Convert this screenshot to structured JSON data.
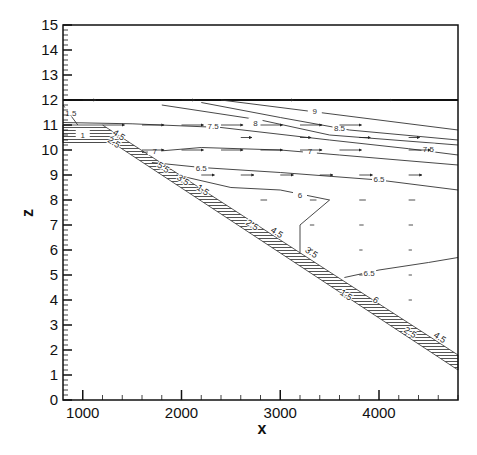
{
  "chart_data": {
    "type": "contour",
    "title": "",
    "xlabel": "x",
    "ylabel": "z",
    "xlim": [
      800,
      4800
    ],
    "ylim": [
      0,
      15
    ],
    "x_ticks": [
      1000,
      2000,
      3000,
      4000
    ],
    "x_tick_labels": [
      "1000",
      "2000",
      "3000",
      "4000"
    ],
    "y_ticks": [
      0,
      1,
      2,
      3,
      4,
      5,
      6,
      7,
      8,
      9,
      10,
      11,
      12,
      13,
      14,
      15
    ],
    "y_tick_labels": [
      "0",
      "1",
      "2",
      "3",
      "4",
      "5",
      "6",
      "7",
      "8",
      "9",
      "10",
      "11",
      "12",
      "13",
      "14",
      "15"
    ],
    "grid": false,
    "legend": null,
    "surface_z": 12,
    "bed_outline": {
      "top": [
        [
          800,
          11
        ],
        [
          1200,
          11
        ],
        [
          4800,
          1.8
        ]
      ],
      "bottom": [
        [
          800,
          10.3
        ],
        [
          1300,
          10.3
        ],
        [
          4800,
          1.2
        ]
      ]
    },
    "contours": [
      {
        "level": 9,
        "label": "9",
        "points": [
          [
            2400,
            12
          ],
          [
            3200,
            11.6
          ],
          [
            4000,
            11.2
          ],
          [
            4800,
            10.8
          ]
        ],
        "label_at": [
          3350,
          11.55
        ]
      },
      {
        "level": 8.5,
        "label": "8.5",
        "points": [
          [
            2200,
            11.9
          ],
          [
            3000,
            11.3
          ],
          [
            3700,
            10.8
          ],
          [
            4800,
            10.4
          ]
        ],
        "label_at": [
          3600,
          10.9
        ]
      },
      {
        "level": 8,
        "label": "8",
        "points": [
          [
            1800,
            11.8
          ],
          [
            2800,
            11.2
          ],
          [
            3500,
            10.6
          ],
          [
            4800,
            10.2
          ]
        ],
        "label_at": [
          2750,
          11.1
        ]
      },
      {
        "level": 7.5,
        "label": "7.5",
        "points": [
          [
            800,
            11.1
          ],
          [
            1500,
            11.05
          ],
          [
            2400,
            10.9
          ],
          [
            3500,
            10.4
          ],
          [
            4300,
            10.05
          ],
          [
            4800,
            9.8
          ]
        ],
        "label_at": [
          2320,
          10.95
        ]
      },
      {
        "level": 7.5,
        "label": "7.5",
        "points": [],
        "label_at": [
          4500,
          10.05
        ]
      },
      {
        "level": 7,
        "label": "7",
        "points": [
          [
            1600,
            9.9
          ],
          [
            2200,
            10.1
          ],
          [
            3000,
            10.0
          ],
          [
            3600,
            9.8
          ],
          [
            4800,
            9.4
          ]
        ],
        "label_at": [
          1730,
          9.95
        ]
      },
      {
        "level": 7,
        "label": "7",
        "points": [],
        "label_at": [
          3300,
          9.95
        ]
      },
      {
        "level": 6.5,
        "label": "6.5",
        "points": [
          [
            1700,
            9.5
          ],
          [
            2200,
            9.3
          ],
          [
            3000,
            9.1
          ],
          [
            4000,
            8.8
          ],
          [
            4800,
            8.4
          ]
        ],
        "label_at": [
          2200,
          9.3
        ]
      },
      {
        "level": 6.5,
        "label": "6.5",
        "points": [],
        "label_at": [
          4000,
          8.85
        ]
      },
      {
        "level": 6,
        "label": "6",
        "points": [
          [
            1950,
            9.0
          ],
          [
            2500,
            8.5
          ],
          [
            3000,
            8.4
          ],
          [
            3500,
            8.0
          ],
          [
            3200,
            7.0
          ],
          [
            3200,
            5.9
          ]
        ],
        "label_at": [
          3200,
          8.2
        ]
      },
      {
        "level": 6.5,
        "label": "6.5",
        "points": [
          [
            3650,
            4.9
          ],
          [
            4000,
            5.2
          ],
          [
            4500,
            5.5
          ],
          [
            4800,
            5.7
          ]
        ],
        "label_at": [
          3900,
          5.1
        ]
      },
      {
        "level": 1.5,
        "label": "1.5",
        "points": [
          [
            800,
            11.8
          ],
          [
            950,
            11.0
          ]
        ],
        "label_at": [
          880,
          11.5
        ]
      },
      {
        "level": 1,
        "label": "1",
        "points": [],
        "label_at": [
          1000,
          10.6
        ]
      }
    ],
    "bed_labels": [
      {
        "label": "4.5",
        "at": [
          1350,
          10.5
        ]
      },
      {
        "label": "2.5",
        "at": [
          1300,
          10.2
        ]
      },
      {
        "label": "5.5",
        "at": [
          1800,
          9.2
        ]
      },
      {
        "label": "3.5",
        "at": [
          2000,
          8.7
        ]
      },
      {
        "label": "1.5",
        "at": [
          2200,
          8.3
        ]
      },
      {
        "label": "2.5",
        "at": [
          2700,
          6.9
        ]
      },
      {
        "label": "4.5",
        "at": [
          2950,
          6.6
        ]
      },
      {
        "label": "3.5",
        "at": [
          3300,
          5.8
        ]
      },
      {
        "label": "1.5",
        "at": [
          3650,
          4.1
        ]
      },
      {
        "label": "6",
        "at": [
          3950,
          3.9
        ]
      },
      {
        "label": "2.5",
        "at": [
          4300,
          2.6
        ]
      },
      {
        "label": "4.5",
        "at": [
          4600,
          2.4
        ]
      }
    ],
    "vectors": {
      "description": "velocity arrows pointing in +x direction",
      "rows": [
        {
          "z": 12,
          "x": [
            1000,
            2000,
            3000,
            4000
          ],
          "len": 0.6
        },
        {
          "z": 11,
          "x": [
            1200,
            1600,
            2000,
            2400,
            2800,
            3200,
            3600
          ],
          "len": 1.0
        },
        {
          "z": 10.5,
          "x": [
            2600,
            3200,
            3800,
            4300
          ],
          "len": 0.5
        },
        {
          "z": 10,
          "x": [
            1600,
            2000,
            2400,
            2800,
            3200,
            3600,
            4300
          ],
          "len": 1.0
        },
        {
          "z": 9,
          "x": [
            2200,
            2600,
            3000,
            3400,
            3800,
            4300
          ],
          "len": 0.6
        },
        {
          "z": 8,
          "x": [
            2800,
            3300,
            3800,
            4300
          ],
          "len": 0.3
        },
        {
          "z": 7,
          "x": [
            3300,
            3800,
            4300
          ],
          "len": 0.2
        },
        {
          "z": 6,
          "x": [
            3300,
            3800,
            4300
          ],
          "len": 0.15
        },
        {
          "z": 5,
          "x": [
            3800,
            4300
          ],
          "len": 0.15
        },
        {
          "z": 4,
          "x": [
            4300
          ],
          "len": 0.15
        }
      ]
    }
  }
}
